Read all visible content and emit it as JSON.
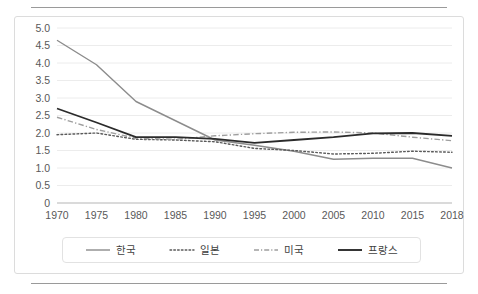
{
  "page": {
    "background": "#ffffff",
    "top_rule": "horizontal-rule",
    "bottom_rule": "horizontal-rule"
  },
  "chart_data": {
    "type": "line",
    "title": "",
    "subtitle": "",
    "xlabel": "",
    "ylabel": "",
    "x": [
      1970,
      1975,
      1980,
      1985,
      1990,
      1995,
      2000,
      2005,
      2010,
      2015,
      2018
    ],
    "categories": [
      "1970",
      "1975",
      "1980",
      "1985",
      "1990",
      "1995",
      "2000",
      "2005",
      "2010",
      "2015",
      "2018"
    ],
    "xlim": [
      1970,
      2018
    ],
    "ylim": [
      0,
      5.0
    ],
    "y_ticks": [
      "0",
      "0.5",
      "1.0",
      "1.5",
      "2.0",
      "2.5",
      "3.0",
      "3.5",
      "4.0",
      "4.5",
      "5.0"
    ],
    "y_tick_values": [
      0,
      0.5,
      1.0,
      1.5,
      2.0,
      2.5,
      3.0,
      3.5,
      4.0,
      4.5,
      5.0
    ],
    "grid": "horizontal",
    "legend_position": "bottom",
    "series": [
      {
        "name": "한국",
        "style": "solid",
        "color": "#8c8c8c",
        "width": 1.4,
        "values": [
          4.65,
          3.95,
          2.9,
          2.35,
          1.8,
          1.65,
          1.48,
          1.25,
          1.28,
          1.28,
          1.0
        ]
      },
      {
        "name": "일본",
        "style": "dotted",
        "color": "#5a5a5a",
        "width": 1.4,
        "values": [
          1.95,
          2.0,
          1.82,
          1.8,
          1.75,
          1.56,
          1.5,
          1.4,
          1.42,
          1.48,
          1.45
        ]
      },
      {
        "name": "미국",
        "style": "dashdot",
        "color": "#9e9e9e",
        "width": 1.4,
        "values": [
          2.45,
          2.1,
          1.85,
          1.82,
          1.92,
          1.98,
          2.02,
          2.03,
          2.0,
          1.88,
          1.78
        ]
      },
      {
        "name": "프랑스",
        "style": "solid",
        "color": "#2b2b2b",
        "width": 1.8,
        "values": [
          2.7,
          2.3,
          1.88,
          1.88,
          1.83,
          1.72,
          1.8,
          1.88,
          1.99,
          2.0,
          1.92
        ]
      }
    ]
  },
  "legend": {
    "items": [
      {
        "label": "한국",
        "swatch": "solid-line-swatch",
        "color": "#8c8c8c"
      },
      {
        "label": "일본",
        "swatch": "dotted-line-swatch",
        "color": "#5a5a5a"
      },
      {
        "label": "미국",
        "swatch": "dashdot-line-swatch",
        "color": "#9e9e9e"
      },
      {
        "label": "프랑스",
        "swatch": "solid-bold-line-swatch",
        "color": "#2b2b2b"
      }
    ]
  }
}
